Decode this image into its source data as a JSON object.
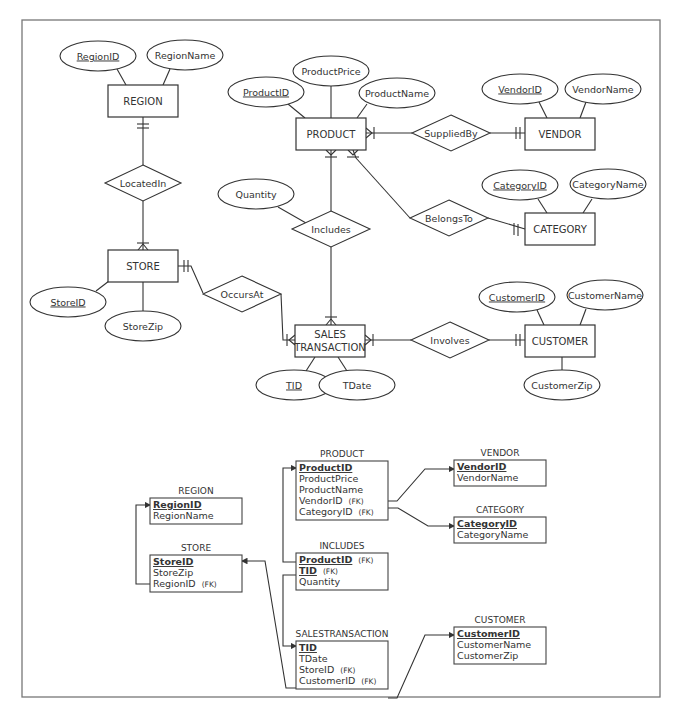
{
  "er_diagram": {
    "entities": [
      {
        "id": "region",
        "label": "REGION",
        "x": 108,
        "y": 85,
        "w": 70,
        "h": 32
      },
      {
        "id": "product",
        "label": "PRODUCT",
        "x": 296,
        "y": 118,
        "w": 70,
        "h": 32
      },
      {
        "id": "vendor",
        "label": "VENDOR",
        "x": 525,
        "y": 118,
        "w": 70,
        "h": 32
      },
      {
        "id": "category",
        "label": "CATEGORY",
        "x": 525,
        "y": 213,
        "w": 70,
        "h": 32
      },
      {
        "id": "store",
        "label": "STORE",
        "x": 108,
        "y": 250,
        "w": 70,
        "h": 32
      },
      {
        "id": "sales_transaction",
        "label": "SALES",
        "label2": "TRANSACTION",
        "x": 295,
        "y": 325,
        "w": 70,
        "h": 32
      },
      {
        "id": "customer",
        "label": "CUSTOMER",
        "x": 525,
        "y": 325,
        "w": 70,
        "h": 32
      }
    ],
    "attributes": [
      {
        "label": "RegionID",
        "key": true,
        "cx": 98,
        "cy": 56,
        "rx": 38,
        "ry": 15
      },
      {
        "label": "RegionName",
        "key": false,
        "cx": 185,
        "cy": 55,
        "rx": 38,
        "ry": 15
      },
      {
        "label": "ProductPrice",
        "key": false,
        "cx": 331,
        "cy": 71,
        "rx": 38,
        "ry": 15
      },
      {
        "label": "ProductID",
        "key": true,
        "cx": 266,
        "cy": 92,
        "rx": 38,
        "ry": 15
      },
      {
        "label": "ProductName",
        "key": false,
        "cx": 397,
        "cy": 93,
        "rx": 38,
        "ry": 15
      },
      {
        "label": "VendorID",
        "key": true,
        "cx": 520,
        "cy": 89,
        "rx": 38,
        "ry": 15
      },
      {
        "label": "VendorName",
        "key": false,
        "cx": 603,
        "cy": 89,
        "rx": 38,
        "ry": 15
      },
      {
        "label": "CategoryID",
        "key": true,
        "cx": 520,
        "cy": 185,
        "rx": 38,
        "ry": 15
      },
      {
        "label": "CategoryName",
        "key": false,
        "cx": 608,
        "cy": 184,
        "rx": 38,
        "ry": 15
      },
      {
        "label": "Quantity",
        "key": false,
        "cx": 256,
        "cy": 194,
        "rx": 38,
        "ry": 15
      },
      {
        "label": "StoreID",
        "key": true,
        "cx": 68,
        "cy": 302,
        "rx": 38,
        "ry": 15
      },
      {
        "label": "StoreZip",
        "key": false,
        "cx": 143,
        "cy": 326,
        "rx": 38,
        "ry": 15
      },
      {
        "label": "CustomerID",
        "key": true,
        "cx": 517,
        "cy": 297,
        "rx": 38,
        "ry": 15
      },
      {
        "label": "CustomerName",
        "key": false,
        "cx": 605,
        "cy": 295,
        "rx": 38,
        "ry": 15
      },
      {
        "label": "CustomerZip",
        "key": false,
        "cx": 562,
        "cy": 385,
        "rx": 38,
        "ry": 15
      },
      {
        "label": "TID",
        "key": true,
        "cx": 294,
        "cy": 385,
        "rx": 38,
        "ry": 15
      },
      {
        "label": "TDate",
        "key": false,
        "cx": 357,
        "cy": 385,
        "rx": 38,
        "ry": 15
      }
    ],
    "relationships": [
      {
        "label": "LocatedIn",
        "cx": 143,
        "cy": 183,
        "hw": 38,
        "hh": 18
      },
      {
        "label": "SuppliedBy",
        "cx": 451,
        "cy": 133,
        "hw": 39,
        "hh": 18
      },
      {
        "label": "BelongsTo",
        "cx": 449,
        "cy": 218,
        "hw": 39,
        "hh": 18
      },
      {
        "label": "Includes",
        "cx": 331,
        "cy": 229,
        "hw": 39,
        "hh": 18
      },
      {
        "label": "OccursAt",
        "cx": 242,
        "cy": 294,
        "hw": 39,
        "hh": 18
      },
      {
        "label": "Involves",
        "cx": 450,
        "cy": 340,
        "hw": 39,
        "hh": 18
      }
    ]
  },
  "relational_schema": {
    "tables": [
      {
        "id": "region",
        "title": "REGION",
        "x": 150,
        "y": 498,
        "w": 92,
        "fields": [
          {
            "name": "RegionID",
            "pk": true,
            "fk": ""
          },
          {
            "name": "RegionName",
            "pk": false,
            "fk": ""
          }
        ]
      },
      {
        "id": "store",
        "title": "STORE",
        "x": 150,
        "y": 555,
        "w": 92,
        "fields": [
          {
            "name": "StoreID",
            "pk": true,
            "fk": ""
          },
          {
            "name": "StoreZip",
            "pk": false,
            "fk": ""
          },
          {
            "name": "RegionID",
            "pk": false,
            "fk": "(FK)"
          }
        ]
      },
      {
        "id": "product",
        "title": "PRODUCT",
        "x": 296,
        "y": 461,
        "w": 92,
        "fields": [
          {
            "name": "ProductID",
            "pk": true,
            "fk": ""
          },
          {
            "name": "ProductPrice",
            "pk": false,
            "fk": ""
          },
          {
            "name": "ProductName",
            "pk": false,
            "fk": ""
          },
          {
            "name": "VendorID",
            "pk": false,
            "fk": "(FK)"
          },
          {
            "name": "CategoryID",
            "pk": false,
            "fk": "(FK)"
          }
        ]
      },
      {
        "id": "vendor",
        "title": "VENDOR",
        "x": 454,
        "y": 460,
        "w": 92,
        "fields": [
          {
            "name": "VendorID",
            "pk": true,
            "fk": ""
          },
          {
            "name": "VendorName",
            "pk": false,
            "fk": ""
          }
        ]
      },
      {
        "id": "category",
        "title": "CATEGORY",
        "x": 454,
        "y": 517,
        "w": 92,
        "fields": [
          {
            "name": "CategoryID",
            "pk": true,
            "fk": ""
          },
          {
            "name": "CategoryName",
            "pk": false,
            "fk": ""
          }
        ]
      },
      {
        "id": "includes",
        "title": "INCLUDES",
        "x": 296,
        "y": 553,
        "w": 92,
        "fields": [
          {
            "name": "ProductID",
            "pk": true,
            "fk": "(FK)"
          },
          {
            "name": "TID",
            "pk": true,
            "fk": "(FK)"
          },
          {
            "name": "Quantity",
            "pk": false,
            "fk": ""
          }
        ]
      },
      {
        "id": "salestransaction",
        "title": "SALESTRANSACTION",
        "x": 296,
        "y": 641,
        "w": 92,
        "fields": [
          {
            "name": "TID",
            "pk": true,
            "fk": ""
          },
          {
            "name": "TDate",
            "pk": false,
            "fk": ""
          },
          {
            "name": "StoreID",
            "pk": false,
            "fk": "(FK)"
          },
          {
            "name": "CustomerID",
            "pk": false,
            "fk": "(FK)"
          }
        ]
      },
      {
        "id": "customer",
        "title": "CUSTOMER",
        "x": 454,
        "y": 627,
        "w": 92,
        "fields": [
          {
            "name": "CustomerID",
            "pk": true,
            "fk": ""
          },
          {
            "name": "CustomerName",
            "pk": false,
            "fk": ""
          },
          {
            "name": "CustomerZip",
            "pk": false,
            "fk": ""
          }
        ]
      }
    ]
  }
}
